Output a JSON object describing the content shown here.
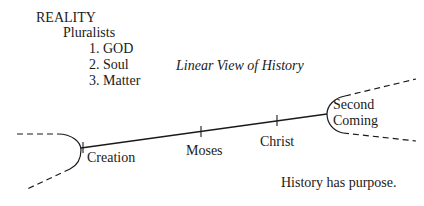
{
  "outline": {
    "heading": "REALITY",
    "subheading": "Pluralists",
    "items": [
      "1. GOD",
      "2. Soul",
      "3. Matter"
    ]
  },
  "diagram": {
    "title": "Linear View of History",
    "events": [
      {
        "label": "Creation"
      },
      {
        "label": "Moses"
      },
      {
        "label": "Christ"
      },
      {
        "label": "Second"
      },
      {
        "label": "Coming"
      }
    ],
    "caption": "History has purpose.",
    "line_color": "#1a1a1a"
  }
}
